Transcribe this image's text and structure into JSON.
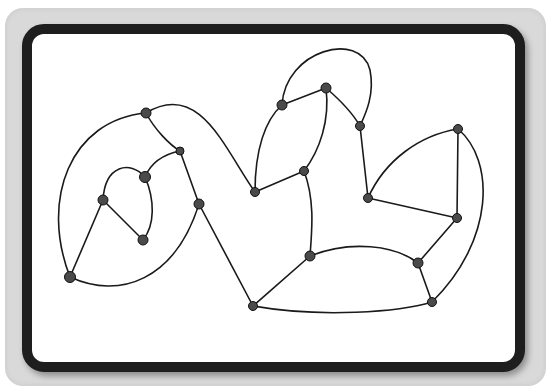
{
  "caption": "Graph diagram (caption clipped at top)",
  "colors": {
    "card": "#d9d9d9",
    "frame_border": "#1e1e1e",
    "canvas": "#ffffff",
    "edge": "#1a1a1a",
    "node_fill": "#4a4a4a",
    "node_stroke": "#111111"
  },
  "graph": {
    "nodes": [
      {
        "id": "n1",
        "x": 146,
        "y": 113,
        "r": 5
      },
      {
        "id": "n2",
        "x": 180,
        "y": 151,
        "r": 4
      },
      {
        "id": "n3",
        "x": 145,
        "y": 177,
        "r": 5.5
      },
      {
        "id": "n4",
        "x": 103,
        "y": 200,
        "r": 5
      },
      {
        "id": "n5",
        "x": 143,
        "y": 240,
        "r": 5
      },
      {
        "id": "n6",
        "x": 199,
        "y": 204,
        "r": 5
      },
      {
        "id": "n7",
        "x": 70,
        "y": 277,
        "r": 5.5
      },
      {
        "id": "n8",
        "x": 282,
        "y": 105,
        "r": 5
      },
      {
        "id": "n9",
        "x": 326,
        "y": 88,
        "r": 5
      },
      {
        "id": "n10",
        "x": 360,
        "y": 126,
        "r": 4.5
      },
      {
        "id": "n11",
        "x": 255,
        "y": 192,
        "r": 4.5
      },
      {
        "id": "n12",
        "x": 304,
        "y": 171,
        "r": 4.5
      },
      {
        "id": "n13",
        "x": 368,
        "y": 198,
        "r": 4.5
      },
      {
        "id": "n14",
        "x": 458,
        "y": 129,
        "r": 4.5
      },
      {
        "id": "n15",
        "x": 457,
        "y": 218,
        "r": 4.5
      },
      {
        "id": "n16",
        "x": 418,
        "y": 263,
        "r": 5
      },
      {
        "id": "n17",
        "x": 432,
        "y": 302,
        "r": 4.5
      },
      {
        "id": "n18",
        "x": 310,
        "y": 256,
        "r": 5
      },
      {
        "id": "n19",
        "x": 253,
        "y": 306,
        "r": 4.5
      }
    ],
    "edges": [
      {
        "d": "M146,113 C70,120 40,200 70,277"
      },
      {
        "d": "M146,113 C155,130 170,145 180,151"
      },
      {
        "d": "M146,113 C200,80 225,150 255,192"
      },
      {
        "d": "M180,151 C160,155 150,165 145,177"
      },
      {
        "d": "M180,151 L199,204"
      },
      {
        "d": "M145,177 C130,160 105,165 103,200"
      },
      {
        "d": "M145,177 C155,200 155,225 143,240"
      },
      {
        "d": "M103,200 L143,240"
      },
      {
        "d": "M103,200 L70,277"
      },
      {
        "d": "M70,277 C120,300 175,280 199,204"
      },
      {
        "d": "M199,204 L253,306"
      },
      {
        "d": "M255,192 C255,150 265,120 282,105"
      },
      {
        "d": "M255,192 L304,171"
      },
      {
        "d": "M282,105 L326,88"
      },
      {
        "d": "M282,105 C285,50 360,30 370,70 C375,95 365,115 360,126"
      },
      {
        "d": "M326,88 C340,100 352,112 360,126"
      },
      {
        "d": "M326,88 C330,120 320,150 304,171"
      },
      {
        "d": "M304,171 C315,200 312,230 310,256"
      },
      {
        "d": "M360,126 L368,198"
      },
      {
        "d": "M368,198 C385,160 420,135 458,129"
      },
      {
        "d": "M368,198 L457,218"
      },
      {
        "d": "M458,129 L457,218"
      },
      {
        "d": "M458,129 C495,160 495,240 432,302"
      },
      {
        "d": "M457,218 L418,263"
      },
      {
        "d": "M418,263 L432,302"
      },
      {
        "d": "M310,256 C350,240 395,245 418,263"
      },
      {
        "d": "M310,256 L253,306"
      },
      {
        "d": "M253,306 C320,318 400,312 432,302"
      }
    ]
  }
}
